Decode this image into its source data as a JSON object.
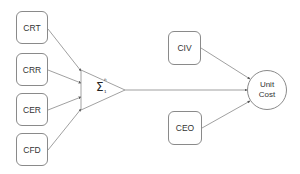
{
  "diagram": {
    "inputs": [
      {
        "label": "CRT"
      },
      {
        "label": "CRR"
      },
      {
        "label": "CER"
      },
      {
        "label": "CFD"
      }
    ],
    "summation": {
      "symbol": "Σ",
      "lower": "1",
      "upper": "n"
    },
    "other_inputs": [
      {
        "label": "CIV"
      },
      {
        "label": "CEO"
      }
    ],
    "output": {
      "line1": "Unit",
      "line2": "Cost"
    },
    "colors": {
      "stroke": "#8a8a8a",
      "arrow": "#555555",
      "text": "#333333"
    }
  }
}
